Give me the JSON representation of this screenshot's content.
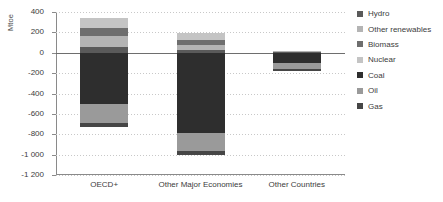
{
  "chart_data": {
    "type": "bar",
    "title": "",
    "subtitle": "",
    "xlabel": "",
    "ylabel": "Mtoe",
    "stacked": true,
    "grid": true,
    "legend_position": "right",
    "ylim": [
      -1200,
      400
    ],
    "yticks": [
      400,
      200,
      0,
      -200,
      -400,
      -600,
      -800,
      -1000,
      -1200
    ],
    "ytick_labels": [
      "400",
      "200",
      "0",
      "-200",
      "-400",
      "-600",
      "-800",
      "-1 000",
      "-1 200"
    ],
    "categories": [
      "OECD+",
      "Other Major Economies",
      "Other Countries"
    ],
    "series": [
      {
        "name": "Hydro",
        "color": "#5a5a5a",
        "values": [
          55,
          25,
          8
        ]
      },
      {
        "name": "Other renewables",
        "color": "#b4b4b4",
        "values": [
          110,
          55,
          12
        ]
      },
      {
        "name": "Biomass",
        "color": "#6e6e6e",
        "values": [
          75,
          45,
          0
        ]
      },
      {
        "name": "Nuclear",
        "color": "#c4c4c4",
        "values": [
          100,
          70,
          0
        ]
      },
      {
        "name": "Coal",
        "color": "#2e2e2e",
        "values": [
          -500,
          -790,
          -100
        ]
      },
      {
        "name": "Oil",
        "color": "#9a9a9a",
        "values": [
          -190,
          -170,
          -60
        ]
      },
      {
        "name": "Gas",
        "color": "#464646",
        "values": [
          -35,
          -40,
          -15
        ]
      }
    ],
    "positive_totals": [
      340,
      195,
      20
    ],
    "negative_totals": [
      -725,
      -1000,
      -175
    ]
  },
  "legend": {
    "items": [
      {
        "label": "Hydro",
        "swatch": "legend-swatch-hydro"
      },
      {
        "label": "Other renewables",
        "swatch": "legend-swatch-other-renewables"
      },
      {
        "label": "Biomass",
        "swatch": "legend-swatch-biomass"
      },
      {
        "label": "Nuclear",
        "swatch": "legend-swatch-nuclear"
      },
      {
        "label": "Coal",
        "swatch": "legend-swatch-coal"
      },
      {
        "label": "Oil",
        "swatch": "legend-swatch-oil"
      },
      {
        "label": "Gas",
        "swatch": "legend-swatch-gas"
      }
    ]
  }
}
